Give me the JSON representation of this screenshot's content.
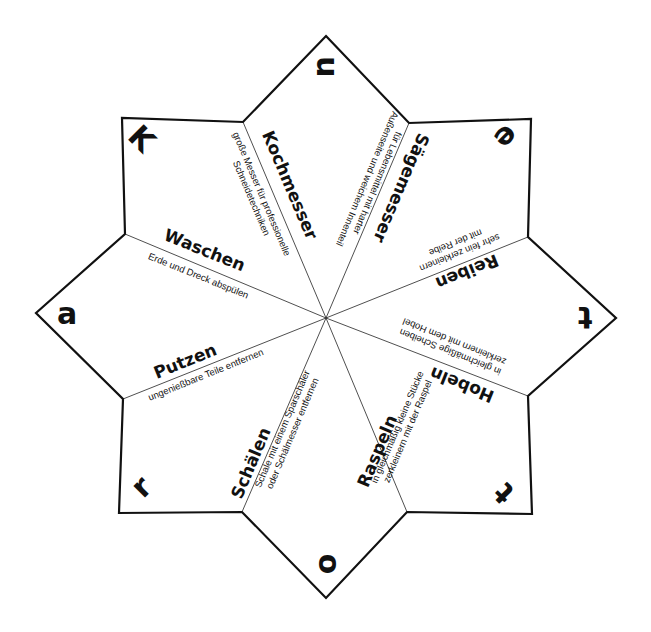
{
  "star": {
    "stroke_color": "#111111",
    "background": "#ffffff",
    "center": [
      326,
      318
    ],
    "vertices": [
      [
        326,
        36
      ],
      [
        409,
        123
      ],
      [
        531,
        119
      ],
      [
        528,
        237
      ],
      [
        616,
        318
      ],
      [
        528,
        396
      ],
      [
        532,
        514
      ],
      [
        407,
        512
      ],
      [
        326,
        598
      ],
      [
        242,
        512
      ],
      [
        119,
        513
      ],
      [
        123,
        399
      ],
      [
        36,
        313
      ],
      [
        125,
        234
      ],
      [
        122,
        118
      ],
      [
        243,
        122
      ]
    ]
  },
  "sections": [
    {
      "title": "Kochmesser",
      "description_line1": "große Messer für professionelle",
      "description_line2": "Schneidetechniken"
    },
    {
      "title": "Sägemesser",
      "description_line1": "für Lebensmittel mit harter",
      "description_line2": "Außenseite und weichem Innenteil"
    },
    {
      "title": "Reiben",
      "description_line1": "sehr fein zerkleinern",
      "description_line2": "mit der Reibe"
    },
    {
      "title": "Hobeln",
      "description_line1": "in gleichmäßige Scheiben",
      "description_line2": "zerkleinern mit dem Hobel"
    },
    {
      "title": "Raspeln",
      "description_line1": "in gleichmäßig kleine Stücke",
      "description_line2": "zerkleinern mit der Raspel"
    },
    {
      "title": "Schälen",
      "description_line1": "Schale mit einem Sparschäler",
      "description_line2": "oder Schälmesser entfernen"
    },
    {
      "title": "Putzen",
      "description_line1": "ungenießbare Teile entfernen",
      "description_line2": ""
    },
    {
      "title": "Waschen",
      "description_line1": "Erde und Dreck abspülen",
      "description_line2": ""
    }
  ],
  "letters": {
    "top": "u",
    "top_right": "e",
    "right": "t",
    "bottom_right": "t",
    "bottom": "o",
    "bottom_left": "r",
    "left": "a",
    "top_left": "K"
  }
}
